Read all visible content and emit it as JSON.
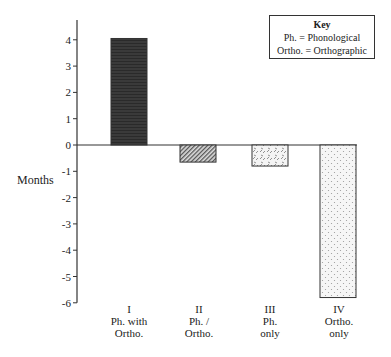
{
  "chart_data": {
    "type": "bar",
    "title": "",
    "xlabel": "",
    "ylabel": "Months",
    "ylim": [
      -6,
      4.5
    ],
    "yticks": [
      4,
      3,
      2,
      1,
      0,
      -1,
      -2,
      -3,
      -4,
      -5,
      -6
    ],
    "grid": false,
    "categories": [
      {
        "numeral": "I",
        "line1": "Ph. with",
        "line2": "Ortho."
      },
      {
        "numeral": "II",
        "line1": "Ph. /",
        "line2": "Ortho."
      },
      {
        "numeral": "III",
        "line1": "Ph.",
        "line2": "only"
      },
      {
        "numeral": "IV",
        "line1": "Ortho.",
        "line2": "only"
      }
    ],
    "values": [
      4.05,
      -0.65,
      -0.8,
      -5.8
    ],
    "fills": [
      "dark-solid",
      "diagonal-hatch",
      "cross-dash",
      "dots"
    ],
    "legend": {
      "position": "top-right",
      "title": "Key",
      "entries": [
        "Ph. = Phonological",
        "Ortho. = Orthographic"
      ]
    }
  }
}
